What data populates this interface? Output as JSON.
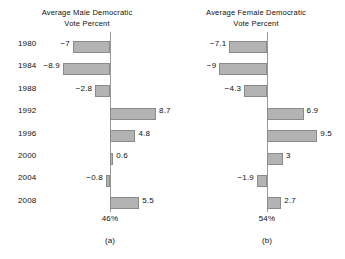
{
  "chart_data": [
    {
      "type": "bar",
      "orientation": "horizontal",
      "panel": "a",
      "title": "Average Male Democratic Vote Percent",
      "title_line1": "Average Male Democratic",
      "title_line2": "Vote Percent",
      "caption": "(a)",
      "axis_total": "46%",
      "categories": [
        "1980",
        "1984",
        "1988",
        "1992",
        "1996",
        "2000",
        "2004",
        "2008"
      ],
      "values": [
        -7,
        -8.9,
        -2.8,
        8.7,
        4.8,
        0.6,
        -0.8,
        5.5
      ],
      "value_labels": [
        "−7",
        "−8.9",
        "−2.8",
        "8.7",
        "4.8",
        "0.6",
        "−0.8",
        "5.5"
      ],
      "xlabel": "",
      "ylabel": "",
      "grid": false,
      "legend": "none",
      "bar_color": "#b3b3b3",
      "bar_border_color": "#8a8a8a",
      "axis_color": "#9a9a9a",
      "zero_reference": 0
    },
    {
      "type": "bar",
      "orientation": "horizontal",
      "panel": "b",
      "title": "Average Female Democratic Vote Percent",
      "title_line1": "Average Female Democratic",
      "title_line2": "Vote Percent",
      "caption": "(b)",
      "axis_total": "54%",
      "categories": [
        "1980",
        "1984",
        "1988",
        "1992",
        "1996",
        "2000",
        "2004",
        "2008"
      ],
      "values": [
        -7.1,
        -9,
        -4.3,
        6.9,
        9.5,
        3,
        -1.9,
        2.7
      ],
      "value_labels": [
        "−7.1",
        "−9",
        "−4.3",
        "6.9",
        "9.5",
        "3",
        "−1.9",
        "2.7"
      ],
      "xlabel": "",
      "ylabel": "",
      "grid": false,
      "legend": "none",
      "bar_color": "#b3b3b3",
      "bar_border_color": "#8a8a8a",
      "axis_color": "#9a9a9a",
      "zero_reference": 0
    }
  ]
}
